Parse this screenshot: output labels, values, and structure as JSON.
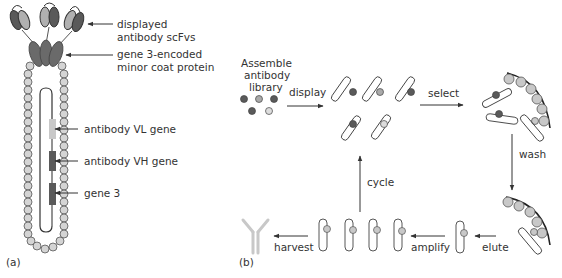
{
  "panel_a": {
    "tag": "(a)",
    "labels": {
      "scfv_line1": "displayed",
      "scfv_line2": "antibody scFvs",
      "coat_line1": "gene 3-encoded",
      "coat_line2": "minor coat protein",
      "vl_gene": "antibody VL gene",
      "vh_gene": "antibody VH gene",
      "gene3": "gene 3"
    }
  },
  "panel_b": {
    "tag": "(b)",
    "library_line1": "Assemble",
    "library_line2": "antibody",
    "library_line3": "library",
    "steps": {
      "display": "display",
      "select": "select",
      "wash": "wash",
      "elute": "elute",
      "amplify": "amplify",
      "harvest": "harvest",
      "cycle": "cycle"
    }
  },
  "colors": {
    "dark": "#5a5a5a",
    "mid": "#8a8a8a",
    "light": "#c8c8c8",
    "bead": "#d4d4d4",
    "outline": "#333333"
  }
}
